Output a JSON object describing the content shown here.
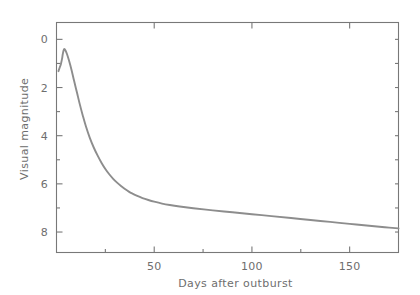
{
  "chart_data": {
    "type": "line",
    "title": "",
    "xlabel": "Days after outburst",
    "ylabel": "Visual magnitude",
    "xlim": [
      0,
      175
    ],
    "ylim": [
      8.85,
      -0.7
    ],
    "y_inverted": true,
    "grid": false,
    "legend": null,
    "axis_color": "#787878",
    "text_color": "#6e6e6e",
    "series_color": "#8d8d8d",
    "background": "#ffffff",
    "xticks_major": [
      50,
      100,
      150
    ],
    "xtick_labels": [
      "50",
      "100",
      "150"
    ],
    "xticks_minor": [
      25,
      75,
      125,
      175
    ],
    "yticks_major": [
      0,
      2,
      4,
      6,
      8
    ],
    "ytick_labels": [
      "0",
      "2",
      "4",
      "6",
      "8"
    ],
    "yticks_minor": [
      1,
      3,
      5,
      7
    ],
    "series": [
      {
        "name": "Nova visual light curve",
        "x": [
          1.0,
          1.6,
          2.2,
          2.8,
          3.2,
          3.6,
          4.0,
          4.6,
          5.4,
          6.4,
          7.6,
          9.0,
          10.5,
          12.0,
          13.5,
          15.0,
          17.0,
          19.0,
          21.0,
          23.0,
          25.0,
          27.0,
          29.0,
          31.0,
          33.0,
          35.0,
          37.0,
          39.0,
          41.0,
          44.0,
          47.0,
          50.0,
          54.0,
          58.0,
          63.0,
          70.0,
          80.0,
          90.0,
          100.0,
          110.0,
          120.0,
          130.0,
          140.0,
          150.0,
          160.0,
          168.0,
          175.0
        ],
        "y": [
          1.32,
          1.18,
          1.04,
          0.82,
          0.62,
          0.46,
          0.4,
          0.46,
          0.62,
          0.88,
          1.24,
          1.72,
          2.22,
          2.72,
          3.18,
          3.6,
          4.08,
          4.48,
          4.82,
          5.12,
          5.38,
          5.6,
          5.79,
          5.95,
          6.09,
          6.21,
          6.32,
          6.41,
          6.49,
          6.59,
          6.67,
          6.74,
          6.82,
          6.88,
          6.94,
          7.01,
          7.1,
          7.18,
          7.26,
          7.34,
          7.42,
          7.5,
          7.58,
          7.66,
          7.74,
          7.8,
          7.85
        ]
      }
    ]
  }
}
